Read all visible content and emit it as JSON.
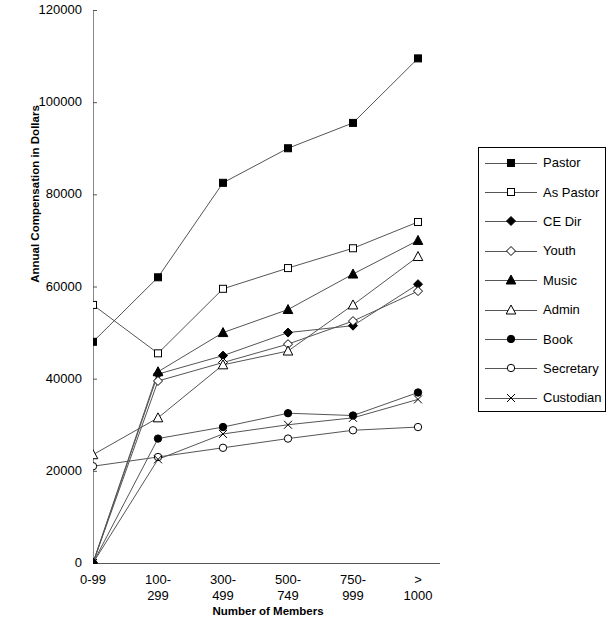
{
  "chart_data": {
    "type": "line",
    "title": "",
    "xlabel": "Number of Members",
    "ylabel": "Annual Compensation in Dollars",
    "categories": [
      "0-99",
      "100-299",
      "300-499",
      "500-749",
      "750-999",
      "> 1000"
    ],
    "category_lines": [
      [
        "0-99"
      ],
      [
        "100-",
        "299"
      ],
      [
        "300-",
        "499"
      ],
      [
        "500-",
        "749"
      ],
      [
        "750-",
        "999"
      ],
      [
        ">",
        "1000"
      ]
    ],
    "ylim": [
      0,
      120000
    ],
    "yticks": [
      0,
      20000,
      40000,
      60000,
      80000,
      100000,
      120000
    ],
    "ytick_labels": [
      "0",
      "20000",
      "40000",
      "60000",
      "80000",
      "100000",
      "120000"
    ],
    "grid": false,
    "legend_position": "right",
    "series": [
      {
        "name": "Pastor",
        "marker": "filled-square",
        "values": [
          48000,
          62000,
          82500,
          90000,
          95500,
          109500
        ]
      },
      {
        "name": "As Pastor",
        "marker": "open-square",
        "values": [
          56000,
          45500,
          59500,
          64000,
          68300,
          74000
        ]
      },
      {
        "name": "CE Dir",
        "marker": "filled-diamond",
        "values": [
          0,
          41000,
          45000,
          50000,
          51500,
          60500
        ]
      },
      {
        "name": "Youth",
        "marker": "open-diamond",
        "values": [
          0,
          39500,
          43500,
          47500,
          52500,
          59000
        ]
      },
      {
        "name": "Music",
        "marker": "filled-triangle",
        "values": [
          0,
          41500,
          50000,
          55000,
          62700,
          70000
        ]
      },
      {
        "name": "Admin",
        "marker": "open-triangle",
        "values": [
          23500,
          31500,
          43000,
          46000,
          56000,
          66500
        ]
      },
      {
        "name": "Book",
        "marker": "filled-circle",
        "values": [
          0,
          27000,
          29500,
          32500,
          32000,
          37000
        ]
      },
      {
        "name": "Secretary",
        "marker": "open-circle",
        "values": [
          21000,
          23000,
          25000,
          27000,
          28800,
          29500
        ]
      },
      {
        "name": "Custodian",
        "marker": "cross",
        "values": [
          0,
          22500,
          28000,
          30000,
          31500,
          35500
        ]
      }
    ]
  },
  "legend": {
    "entries": [
      {
        "label": "Pastor"
      },
      {
        "label": "As Pastor"
      },
      {
        "label": "CE Dir"
      },
      {
        "label": "Youth"
      },
      {
        "label": "Music"
      },
      {
        "label": "Admin"
      },
      {
        "label": "Book"
      },
      {
        "label": "Secretary"
      },
      {
        "label": "Custodian"
      }
    ]
  },
  "colors": {
    "axis": "#000000",
    "line": "#555555",
    "marker": "#000000",
    "background": "#ffffff"
  }
}
